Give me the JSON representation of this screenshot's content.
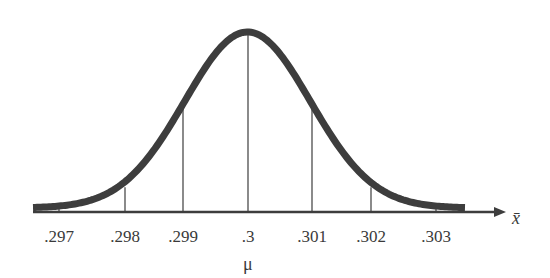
{
  "chart_data": {
    "type": "line",
    "title": "",
    "subtitle": "",
    "xlabel": "x̄",
    "ylabel": "",
    "x_ticks": [
      ".297",
      ".298",
      ".299",
      ".3",
      ".301",
      ".302",
      ".303"
    ],
    "x_tick_values": [
      0.297,
      0.298,
      0.299,
      0.3,
      0.301,
      0.302,
      0.303
    ],
    "mean": 0.3,
    "mean_label": "μ",
    "std_dev": 0.001,
    "xlim": [
      0.2965,
      0.3035
    ],
    "grid": false,
    "legend": null,
    "colors": {
      "curve": "#3d3d3d",
      "axis": "#3d3d3d",
      "lines": "#3d3d3d"
    }
  },
  "axis": {
    "x_symbol": "x̄",
    "mu": "μ",
    "ticks": [
      {
        "label": ".297",
        "x": 59
      },
      {
        "label": ".298",
        "x": 125
      },
      {
        "label": ".299",
        "x": 183
      },
      {
        "label": ".3",
        "x": 248
      },
      {
        "label": ".301",
        "x": 312
      },
      {
        "label": ".302",
        "x": 371
      },
      {
        "label": ".303",
        "x": 436
      }
    ]
  }
}
